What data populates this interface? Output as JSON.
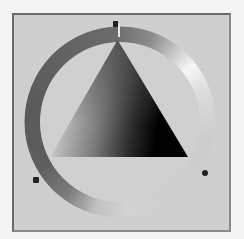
{
  "widget": {
    "type": "hue-ring-triangle-color-picker",
    "mode": "grayscale",
    "selected_hue_deg": 0,
    "markers": [
      {
        "id": "top",
        "label": "",
        "angle_deg": 0,
        "style": "handle"
      },
      {
        "id": "upper-right",
        "label": "",
        "angle_deg": 60,
        "style": "faint"
      },
      {
        "id": "lower-right",
        "label": "",
        "angle_deg": 120,
        "style": "dot"
      },
      {
        "id": "bottom",
        "label": "",
        "angle_deg": 180,
        "style": "faint"
      },
      {
        "id": "lower-left",
        "label": "",
        "angle_deg": 240,
        "style": "dot"
      },
      {
        "id": "upper-left",
        "label": "",
        "angle_deg": 300,
        "style": "faint"
      }
    ]
  },
  "colors": {
    "page_background": "#f4f4f4",
    "panel_background": "#cfcfcf",
    "ring_dark": "#5a5a5a",
    "ring_highlight": "#f6f6f6",
    "triangle_light_corner": "#ffffff",
    "triangle_dark_corner": "#000000",
    "marker_dark": "#222222"
  }
}
